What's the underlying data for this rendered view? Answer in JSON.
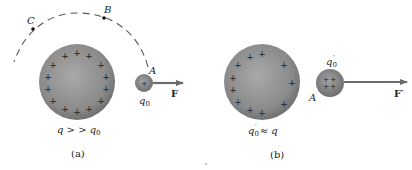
{
  "panel_a": {
    "caption": "(a)",
    "big_charge_label": "q > > q",
    "big_charge_sub": "0",
    "test_charge_label": "q",
    "test_charge_sub": "0",
    "point_A": "A",
    "point_B": "B",
    "point_C": "C",
    "force_label": "F"
  },
  "panel_b": {
    "caption": "(b)",
    "relation_label_q": "q",
    "relation_label_sub": "0",
    "relation_label_prime": "′",
    "relation_label_rest": " ≈ q",
    "test_charge_label": "q",
    "test_charge_sub": "0",
    "test_charge_prime": "′",
    "point_A": "A",
    "force_label": "F′"
  },
  "symbols": {
    "plus": "+"
  },
  "colors": {
    "sphere_dark": "#6e6e6e",
    "sphere_light": "#a8a8a8",
    "arrow": "#6b6b6b",
    "dash": "#555555",
    "text": "#222222"
  }
}
